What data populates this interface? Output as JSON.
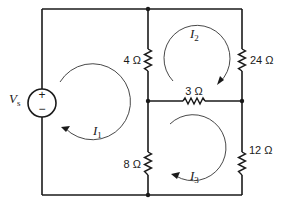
{
  "diagram": {
    "type": "circuit-schematic",
    "source": {
      "label_main": "V",
      "label_sub": "s",
      "plus": "+",
      "minus": "−"
    },
    "resistors": {
      "r_left_top": "4 Ω",
      "r_left_bottom": "8 Ω",
      "r_middle": "3 Ω",
      "r_right_top": "24 Ω",
      "r_right_bottom": "12 Ω"
    },
    "mesh_currents": [
      {
        "main": "I",
        "sub": "1",
        "direction": "clockwise"
      },
      {
        "main": "I",
        "sub": "2",
        "direction": "clockwise"
      },
      {
        "main": "I",
        "sub": "3",
        "direction": "clockwise"
      }
    ]
  }
}
